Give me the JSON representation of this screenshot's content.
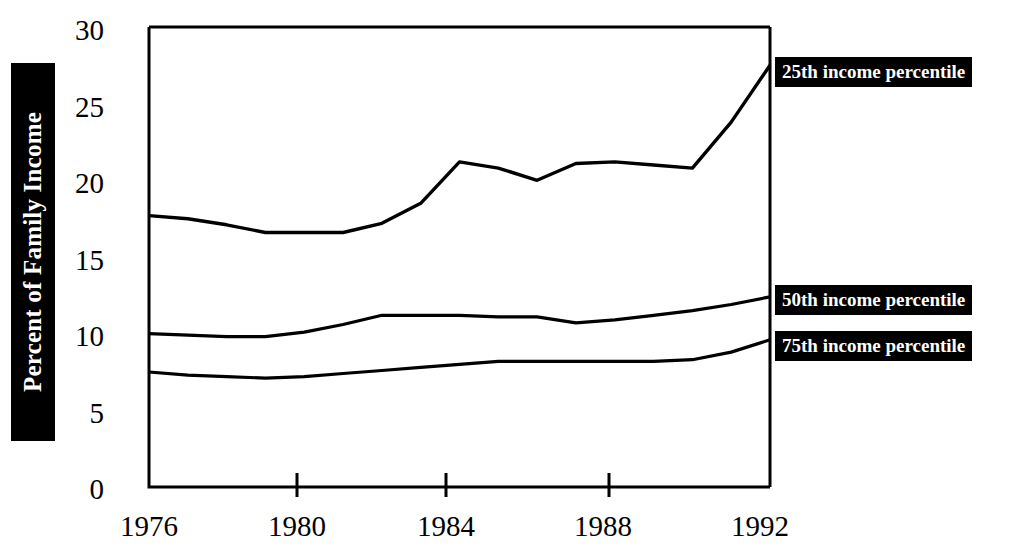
{
  "chart_data": {
    "type": "line",
    "title": "",
    "xlabel": "",
    "ylabel": "Percent of Family Income",
    "xlim": [
      1976,
      1992
    ],
    "ylim": [
      0,
      30
    ],
    "grid": false,
    "legend_position": "right-inline-callouts",
    "x": [
      1976,
      1977,
      1978,
      1979,
      1980,
      1981,
      1982,
      1983,
      1984,
      1985,
      1986,
      1987,
      1988,
      1989,
      1990,
      1991,
      1992
    ],
    "xticks": [
      "1976",
      "1980",
      "1984",
      "1988",
      "1992"
    ],
    "xtick_values": [
      1976,
      1980,
      1984,
      1988,
      1992
    ],
    "yticks": [
      "0",
      "5",
      "10",
      "15",
      "20",
      "25",
      "30"
    ],
    "ytick_values": [
      0,
      5,
      10,
      15,
      20,
      25,
      30
    ],
    "series": [
      {
        "name": "25th income percentile",
        "color": "#000000",
        "values": [
          17.7,
          17.5,
          17.1,
          16.6,
          16.6,
          16.6,
          17.2,
          18.5,
          21.2,
          20.8,
          20.0,
          21.1,
          21.2,
          21.0,
          20.8,
          23.8,
          27.5
        ]
      },
      {
        "name": "50th income percentile",
        "color": "#000000",
        "values": [
          10.0,
          9.9,
          9.8,
          9.8,
          10.1,
          10.6,
          11.2,
          11.2,
          11.2,
          11.1,
          11.1,
          10.7,
          10.9,
          11.2,
          11.5,
          11.9,
          12.4
        ]
      },
      {
        "name": "75th income percentile",
        "color": "#000000",
        "values": [
          7.5,
          7.3,
          7.2,
          7.1,
          7.2,
          7.4,
          7.6,
          7.8,
          8.0,
          8.2,
          8.2,
          8.2,
          8.2,
          8.2,
          8.3,
          8.8,
          9.6
        ]
      }
    ]
  },
  "axis": {
    "y_title": "Percent of Family Income",
    "y_ticks": [
      "30",
      "25",
      "20",
      "15",
      "10",
      "5",
      "0"
    ],
    "x_ticks": [
      "1976",
      "1980",
      "1984",
      "1988",
      "1992"
    ]
  },
  "labels": {
    "p25": "25th income percentile",
    "p50": "50th income percentile",
    "p75": "75th income percentile"
  },
  "colors": {
    "ink": "#000000",
    "paper": "#ffffff",
    "label_background": "#000000",
    "label_text": "#ffffff"
  }
}
